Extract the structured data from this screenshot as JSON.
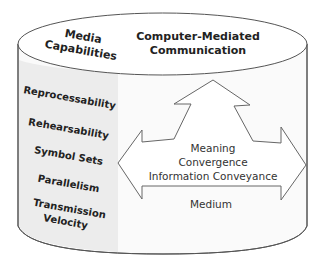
{
  "diagram": {
    "container_label": "Medium",
    "top": {
      "left_title_line1": "Media",
      "left_title_line2": "Capabilities",
      "right_title_line1": "Computer-Mediated",
      "right_title_line2": "Communication"
    },
    "capabilities": [
      {
        "label": "Reprocessability"
      },
      {
        "label": "Rehearsability"
      },
      {
        "label": "Symbol Sets"
      },
      {
        "label": "Parallelism"
      },
      {
        "label": "Transmission",
        "label2": "Velocity"
      }
    ],
    "arrows": {
      "up_label_line1": "Meaning",
      "up_label_line2": "Convergence",
      "horizontal_label": "Information Conveyance"
    },
    "colors": {
      "stroke": "#555555",
      "band": "#ececec",
      "body": "#fafafa",
      "top": "#ffffff"
    }
  }
}
